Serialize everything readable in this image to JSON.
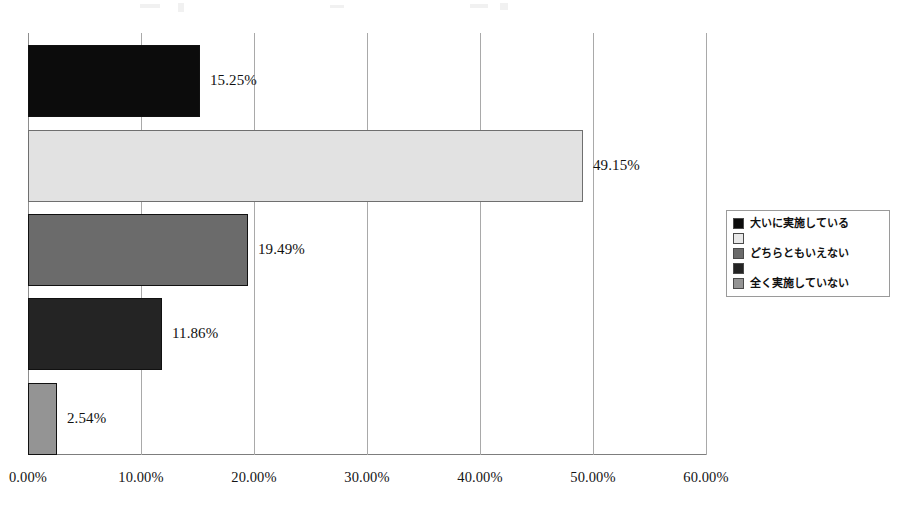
{
  "chart_data": {
    "type": "bar",
    "orientation": "horizontal",
    "title": "",
    "subtitle": "",
    "xlabel": "",
    "ylabel": "",
    "categories": [
      "大いに実施している",
      "",
      "どちらともいえない",
      "",
      "全く実施していない"
    ],
    "values": [
      15.25,
      49.15,
      19.49,
      11.86,
      2.54
    ],
    "data_labels": [
      "15.25%",
      "49.15%",
      "19.49%",
      "11.86%",
      "2.54%"
    ],
    "xlim": [
      0,
      60
    ],
    "xtick_step": 10,
    "xtick_labels": [
      "0.00%",
      "10.00%",
      "20.00%",
      "30.00%",
      "40.00%",
      "50.00%",
      "60.00%"
    ],
    "xtick_values": [
      0,
      10,
      20,
      30,
      40,
      50,
      60
    ],
    "grid": "vertical",
    "legend_position": "right",
    "bar_colors": [
      "#0c0c0c",
      "#e2e2e2",
      "#6b6b6b",
      "#242424",
      "#949494"
    ],
    "legend": [
      {
        "label": "大いに実施している",
        "color": "#0c0c0c"
      },
      {
        "label": "",
        "color": "#e8e8e8"
      },
      {
        "label": "どちらともいえない",
        "color": "#6b6b6b"
      },
      {
        "label": "",
        "color": "#242424"
      },
      {
        "label": "全く実施していない",
        "color": "#949494"
      }
    ]
  }
}
